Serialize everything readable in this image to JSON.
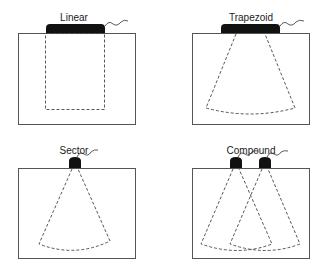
{
  "figure": {
    "panels": [
      {
        "id": "linear",
        "label": "Linear",
        "beam_shape": "rectangle",
        "probe_count": 1
      },
      {
        "id": "trapezoid",
        "label": "Trapezoid",
        "beam_shape": "trapezoid",
        "probe_count": 1
      },
      {
        "id": "sector",
        "label": "Sector",
        "beam_shape": "sector",
        "probe_count": 1
      },
      {
        "id": "compound",
        "label": "Compound",
        "beam_shape": "overlapping-sectors",
        "probe_count": 2
      }
    ]
  },
  "colors": {
    "probe": "#111111",
    "outline": "#555555",
    "beam": "#444444",
    "background": "#ffffff"
  }
}
